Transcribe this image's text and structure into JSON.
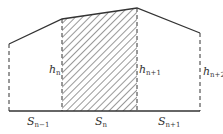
{
  "diagram": {
    "type": "trapezoid-strip-area",
    "colors": {
      "line": "#333333",
      "hatch": "#444444",
      "background": "#ffffff"
    },
    "labels": {
      "h_n": {
        "base": "h",
        "sub": "n"
      },
      "h_n1": {
        "base": "h",
        "sub": "n+1"
      },
      "h_n2": {
        "base": "h",
        "sub": "n+2"
      },
      "s_prev": {
        "base": "S",
        "sub": "n−1"
      },
      "s_n": {
        "base": "S",
        "sub": "n"
      },
      "s_next": {
        "base": "S",
        "sub": "n+1"
      }
    },
    "segments": [
      {
        "name": "S(n-1)",
        "hatched": false
      },
      {
        "name": "S(n)",
        "hatched": true
      },
      {
        "name": "S(n+1)",
        "hatched": false
      }
    ]
  }
}
